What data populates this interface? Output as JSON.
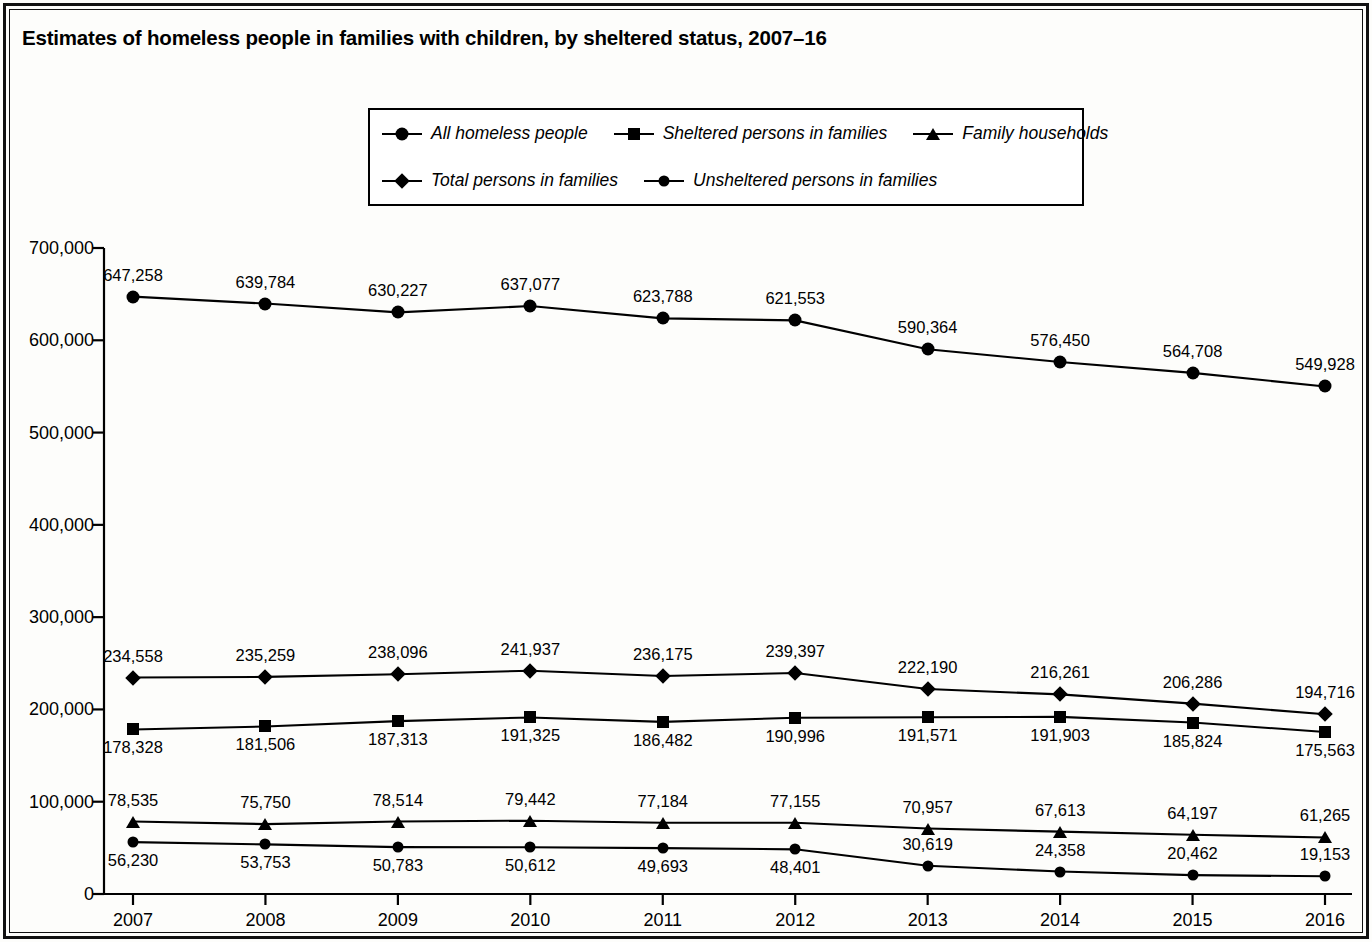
{
  "title": "Estimates of homeless people in families with children, by sheltered status, 2007–16",
  "legend": {
    "rows": [
      [
        {
          "label": "All homeless people",
          "marker": "circle"
        },
        {
          "label": "Sheltered persons in families",
          "marker": "square"
        },
        {
          "label": "Family households",
          "marker": "triangle"
        }
      ],
      [
        {
          "label": "Total persons in families",
          "marker": "diamond"
        },
        {
          "label": "Unsheltered persons in families",
          "marker": "circle-sm"
        }
      ]
    ]
  },
  "chart_data": {
    "type": "line",
    "title": "Estimates of homeless people in families with children, by sheltered status, 2007–16",
    "xlabel": "",
    "ylabel": "",
    "grid": false,
    "legend_position": "top-center",
    "categories": [
      "2007",
      "2008",
      "2009",
      "2010",
      "2011",
      "2012",
      "2013",
      "2014",
      "2015",
      "2016"
    ],
    "x": [
      2007,
      2008,
      2009,
      2010,
      2011,
      2012,
      2013,
      2014,
      2015,
      2016
    ],
    "ylim": [
      0,
      700000
    ],
    "yticks": [
      0,
      100000,
      200000,
      300000,
      400000,
      500000,
      600000,
      700000
    ],
    "ytick_labels": [
      "0",
      "100,000",
      "200,000",
      "300,000",
      "400,000",
      "500,000",
      "600,000",
      "700,000"
    ],
    "series": [
      {
        "name": "All homeless people",
        "marker": "circle",
        "values": [
          647258,
          639784,
          630227,
          637077,
          623788,
          621553,
          590364,
          576450,
          564708,
          549928
        ],
        "labels": [
          "647,258",
          "639,784",
          "630,227",
          "637,077",
          "623,788",
          "621,553",
          "590,364",
          "576,450",
          "564,708",
          "549,928"
        ]
      },
      {
        "name": "Total persons in families",
        "marker": "diamond",
        "values": [
          234558,
          235259,
          238096,
          241937,
          236175,
          239397,
          222190,
          216261,
          206286,
          194716
        ],
        "labels": [
          "234,558",
          "235,259",
          "238,096",
          "241,937",
          "236,175",
          "239,397",
          "222,190",
          "216,261",
          "206,286",
          "194,716"
        ]
      },
      {
        "name": "Sheltered persons in families",
        "marker": "square",
        "values": [
          178328,
          181506,
          187313,
          191325,
          186482,
          190996,
          191571,
          191903,
          185824,
          175563
        ],
        "labels": [
          "178,328",
          "181,506",
          "187,313",
          "191,325",
          "186,482",
          "190,996",
          "191,571",
          "191,903",
          "185,824",
          "175,563"
        ]
      },
      {
        "name": "Family households",
        "marker": "triangle",
        "values": [
          78535,
          75750,
          78514,
          79442,
          77184,
          77155,
          70957,
          67613,
          64197,
          61265
        ],
        "labels": [
          "78,535",
          "75,750",
          "78,514",
          "79,442",
          "77,184",
          "77,155",
          "70,957",
          "67,613",
          "64,197",
          "61,265"
        ]
      },
      {
        "name": "Unsheltered persons in families",
        "marker": "circle-sm",
        "values": [
          56230,
          53753,
          50783,
          50612,
          49693,
          48401,
          30619,
          24358,
          20462,
          19153
        ],
        "labels": [
          "56,230",
          "53,753",
          "50,783",
          "50,612",
          "49,693",
          "48,401",
          "30,619",
          "24,358",
          "20,462",
          "19,153"
        ]
      }
    ]
  },
  "colors": {
    "ink": "#000000",
    "background": "#ffffff"
  }
}
